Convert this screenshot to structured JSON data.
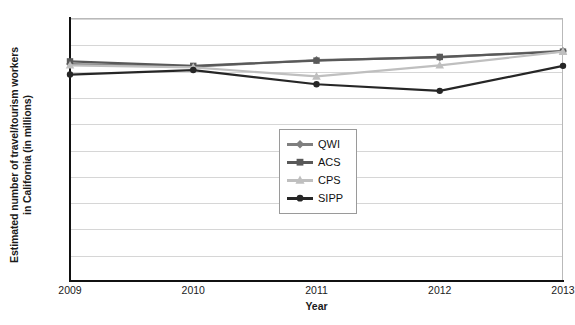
{
  "chart_data": {
    "type": "line",
    "title": "",
    "xlabel": "Year",
    "ylabel": "Estimated number of travel/tourism workers in California (in millions)",
    "ylabel_lines": [
      "Estimated number of travel/tourism workers",
      "in California (in millions)"
    ],
    "categories": [
      "2009",
      "2010",
      "2011",
      "2012",
      "2013"
    ],
    "x": [
      2009,
      2010,
      2011,
      2012,
      2013
    ],
    "ylim": [
      0,
      1.0
    ],
    "ytick_values": [
      0,
      0.1,
      0.2,
      0.3,
      0.4,
      0.5,
      0.6,
      0.7,
      0.8,
      0.9,
      1.0
    ],
    "ytick_labels": [
      "0",
      "0.1",
      "0.2",
      "0.3",
      "0.4",
      "0.5",
      "0.6",
      "0.7",
      "0.8",
      "0.9",
      "1.0"
    ],
    "grid": true,
    "grid_axis": "y",
    "legend_position": "center",
    "series": [
      {
        "name": "QWI",
        "marker": "diamond",
        "color": "#7f7f7f",
        "values": [
          0.825,
          0.815,
          0.84,
          0.85,
          0.875
        ]
      },
      {
        "name": "ACS",
        "marker": "square",
        "color": "#595959",
        "values": [
          0.835,
          0.818,
          0.838,
          0.852,
          0.872
        ]
      },
      {
        "name": "CPS",
        "marker": "triangle",
        "color": "#bfbfbf",
        "values": [
          0.82,
          0.812,
          0.778,
          0.82,
          0.872
        ]
      },
      {
        "name": "SIPP",
        "marker": "circle",
        "color": "#262626",
        "values": [
          0.785,
          0.802,
          0.748,
          0.723,
          0.818
        ]
      }
    ]
  },
  "legend": {
    "items": [
      {
        "label": "QWI"
      },
      {
        "label": "ACS"
      },
      {
        "label": "CPS"
      },
      {
        "label": "SIPP"
      }
    ]
  },
  "axes": {
    "x_title": "Year",
    "y_title_line1": "Estimated number of travel/tourism workers",
    "y_title_line2": "in California (in millions)"
  }
}
